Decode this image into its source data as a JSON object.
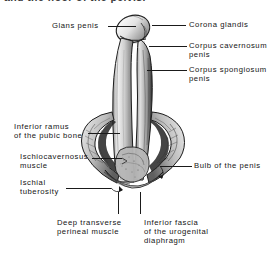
{
  "caption": {
    "text": "and the floor of the pelvis."
  },
  "figure": {
    "art_name": "penis-perineum-illustration"
  },
  "labels": [
    {
      "id": "glans-penis",
      "text": "Glans penis",
      "x": 52,
      "y": 22,
      "align": "right"
    },
    {
      "id": "corona-glandis",
      "text": "Corona glandis",
      "x": 189,
      "y": 21,
      "align": "left"
    },
    {
      "id": "corpus-cavernosum",
      "text": "Corpus cavernosum\npenis",
      "x": 189,
      "y": 42,
      "align": "left"
    },
    {
      "id": "corpus-spongiosum",
      "text": "Corpus spongiosum\npenis",
      "x": 189,
      "y": 66,
      "align": "left"
    },
    {
      "id": "inferior-ramus",
      "text": "Inferior ramus\nof the pubic bone",
      "x": 14,
      "y": 123,
      "align": "right"
    },
    {
      "id": "ischiocavernosus",
      "text": "Ischiocavernosus\nmuscle",
      "x": 20,
      "y": 153,
      "align": "right"
    },
    {
      "id": "ischial-tuberosity",
      "text": "Ischial\ntuberosity",
      "x": 20,
      "y": 179,
      "align": "right"
    },
    {
      "id": "bulb-of-the-penis",
      "text": "Bulb of the penis",
      "x": 194,
      "y": 161,
      "align": "left"
    },
    {
      "id": "deep-transverse-perineal",
      "text": "Deep transverse\nperineal muscle",
      "x": 57,
      "y": 219,
      "align": "center"
    },
    {
      "id": "inferior-fascia",
      "text": "Inferior fascia\nof the urogenital\ndiaphragm",
      "x": 144,
      "y": 219,
      "align": "center"
    }
  ],
  "leaders": [
    {
      "id": "leader-glans-penis",
      "type": "h",
      "x": 108,
      "y": 26,
      "len": 28
    },
    {
      "id": "leader-corona-glandis",
      "type": "h",
      "x": 152,
      "y": 25,
      "len": 34
    },
    {
      "id": "leader-corpus-cavernosum",
      "type": "h",
      "x": 149,
      "y": 46,
      "len": 38
    },
    {
      "id": "leader-corpus-spongiosum",
      "type": "h",
      "x": 147,
      "y": 70,
      "len": 40
    },
    {
      "id": "leader-inferior-ramus",
      "type": "h",
      "x": 88,
      "y": 133,
      "len": 32
    },
    {
      "id": "leader-ischiocavernosus",
      "type": "h",
      "x": 92,
      "y": 158,
      "len": 30
    },
    {
      "id": "leader-ischial-tuberosity",
      "type": "h",
      "x": 66,
      "y": 188,
      "len": 45
    },
    {
      "id": "leader-bulb-penis",
      "type": "h",
      "x": 160,
      "y": 166,
      "len": 32
    },
    {
      "id": "leader-deep-transverse",
      "type": "v",
      "x": 118,
      "y": 192,
      "len": 22
    },
    {
      "id": "leader-inferior-fascia",
      "type": "v",
      "x": 140,
      "y": 192,
      "len": 22
    }
  ],
  "colors": {
    "ink": "#1a1a1a",
    "paper": "#ffffff",
    "shade_dark": "#2a2a2a",
    "shade_mid": "#8d8d8d",
    "shade_light": "#d8d8d8"
  }
}
